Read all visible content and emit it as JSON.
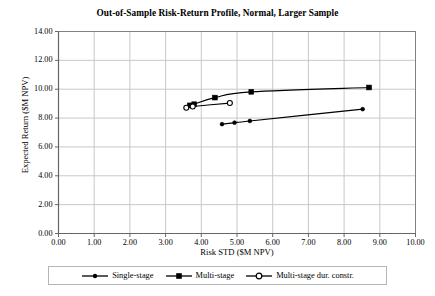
{
  "chart_data": {
    "type": "line",
    "title": "Out-of-Sample Risk-Return Profile, Normal, Larger Sample",
    "xlabel": "Risk STD ($M NPV)",
    "ylabel": "Expected Return ($M NPV)",
    "xlim": [
      0,
      10
    ],
    "ylim": [
      0,
      14
    ],
    "xticks": [
      "0.00",
      "1.00",
      "2.00",
      "3.00",
      "4.00",
      "5.00",
      "6.00",
      "7.00",
      "8.00",
      "9.00",
      "10.00"
    ],
    "yticks": [
      "0.00",
      "2.00",
      "4.00",
      "6.00",
      "8.00",
      "10.00",
      "12.00",
      "14.00"
    ],
    "xtick_values": [
      0,
      1,
      2,
      3,
      4,
      5,
      6,
      7,
      8,
      9,
      10
    ],
    "ytick_values": [
      0,
      2,
      4,
      6,
      8,
      10,
      12,
      14
    ],
    "grid": true,
    "legend_position": "bottom",
    "series": [
      {
        "name": "Single-stage",
        "marker": "filled-circle",
        "color": "#000000",
        "points": [
          {
            "x": 4.58,
            "y": 7.58
          },
          {
            "x": 4.93,
            "y": 7.68
          },
          {
            "x": 5.36,
            "y": 7.8
          },
          {
            "x": 8.52,
            "y": 8.62
          }
        ]
      },
      {
        "name": "Multi-stage",
        "marker": "filled-square",
        "color": "#000000",
        "points": [
          {
            "x": 3.68,
            "y": 8.88
          },
          {
            "x": 3.8,
            "y": 8.96
          },
          {
            "x": 4.38,
            "y": 9.42
          },
          {
            "x": 5.4,
            "y": 9.82
          },
          {
            "x": 8.7,
            "y": 10.12
          }
        ]
      },
      {
        "name": "Multi-stage dur. constr.",
        "marker": "open-circle",
        "color": "#000000",
        "points": [
          {
            "x": 3.58,
            "y": 8.72
          },
          {
            "x": 3.76,
            "y": 8.8
          },
          {
            "x": 4.8,
            "y": 9.04
          }
        ]
      }
    ]
  },
  "legend": {
    "items": [
      {
        "label": "Single-stage",
        "marker": "filled-circle"
      },
      {
        "label": "Multi-stage",
        "marker": "filled-square"
      },
      {
        "label": "Multi-stage dur. constr.",
        "marker": "open-circle"
      }
    ]
  },
  "colors": {
    "axis": "#808080",
    "grid": "#c8c8c8",
    "series": "#000000",
    "background": "#ffffff",
    "legend_border": "#b6b6b6"
  }
}
